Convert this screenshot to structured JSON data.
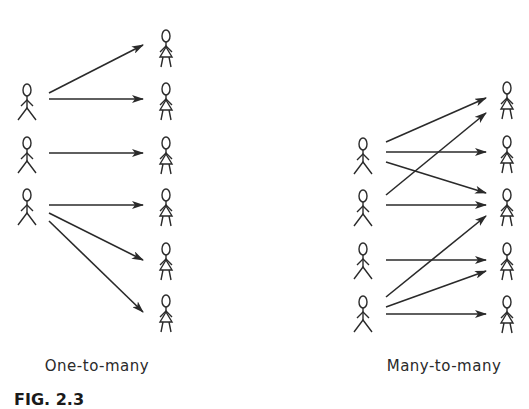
{
  "diagram": {
    "panels": [
      {
        "id": "one-to-many",
        "label": "One-to-many",
        "label_pos": [
          97,
          357
        ],
        "sources": [
          {
            "x": 27,
            "y": 84,
            "type": "male"
          },
          {
            "x": 27,
            "y": 137,
            "type": "male"
          },
          {
            "x": 27,
            "y": 189,
            "type": "male"
          }
        ],
        "targets": [
          {
            "x": 166,
            "y": 30,
            "type": "female"
          },
          {
            "x": 166,
            "y": 83,
            "type": "female"
          },
          {
            "x": 166,
            "y": 137,
            "type": "female"
          },
          {
            "x": 166,
            "y": 189,
            "type": "female"
          },
          {
            "x": 166,
            "y": 243,
            "type": "female"
          },
          {
            "x": 166,
            "y": 295,
            "type": "female"
          }
        ],
        "arrows": [
          [
            49,
            93,
            143,
            45
          ],
          [
            49,
            99,
            143,
            99
          ],
          [
            49,
            153,
            143,
            153
          ],
          [
            49,
            205,
            143,
            205
          ],
          [
            49,
            213,
            143,
            260
          ],
          [
            49,
            221,
            143,
            312
          ]
        ]
      },
      {
        "id": "many-to-many",
        "label": "Many-to-many",
        "label_pos": [
          444,
          357
        ],
        "sources": [
          {
            "x": 363,
            "y": 138,
            "type": "male"
          },
          {
            "x": 363,
            "y": 190,
            "type": "male"
          },
          {
            "x": 363,
            "y": 243,
            "type": "male"
          },
          {
            "x": 363,
            "y": 296,
            "type": "male"
          }
        ],
        "targets": [
          {
            "x": 507,
            "y": 82,
            "type": "female"
          },
          {
            "x": 507,
            "y": 136,
            "type": "female"
          },
          {
            "x": 507,
            "y": 189,
            "type": "female"
          },
          {
            "x": 507,
            "y": 243,
            "type": "female"
          },
          {
            "x": 507,
            "y": 296,
            "type": "female"
          }
        ],
        "arrows": [
          [
            386,
            142,
            486,
            98
          ],
          [
            386,
            152,
            486,
            152
          ],
          [
            386,
            162,
            486,
            193
          ],
          [
            386,
            195,
            486,
            113
          ],
          [
            386,
            205,
            486,
            205
          ],
          [
            386,
            260,
            486,
            260
          ],
          [
            386,
            297,
            486,
            216
          ],
          [
            386,
            307,
            486,
            271
          ],
          [
            386,
            314,
            486,
            314
          ]
        ]
      }
    ],
    "figure_caption": "FIG. 2.3"
  },
  "colors": {
    "ink": "#2a2a2a",
    "background": "#ffffff"
  }
}
